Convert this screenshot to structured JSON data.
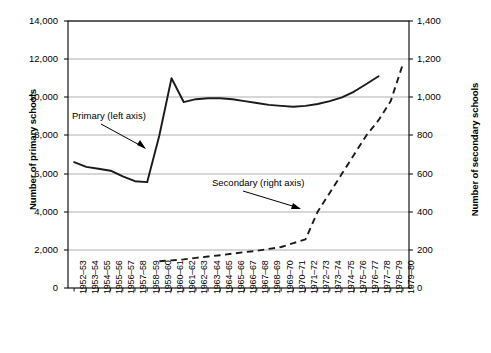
{
  "chart_data": {
    "type": "line",
    "title": "",
    "xlabel": "",
    "ylabel": "Number of primary schools",
    "y2label": "Number of secondary schools",
    "grid": true,
    "legend_position": "inline-annotations",
    "ylim": [
      0,
      14000
    ],
    "y2lim": [
      0,
      1400
    ],
    "yticks": [
      "0",
      "2,000",
      "4,000",
      "6,000",
      "8,000",
      "10,000",
      "12,000",
      "14,000"
    ],
    "ytick_values": [
      0,
      2000,
      4000,
      6000,
      8000,
      10000,
      12000,
      14000
    ],
    "y2ticks": [
      "0",
      "200",
      "400",
      "600",
      "800",
      "1,000",
      "1,200",
      "1,400"
    ],
    "y2tick_values": [
      0,
      200,
      400,
      600,
      800,
      1000,
      1200,
      1400
    ],
    "categories": [
      "1952–53",
      "1953–54",
      "1954–55",
      "1955–56",
      "1956–57",
      "1957–58",
      "1958–59",
      "1959–60",
      "1960–61",
      "1961–62",
      "1962–63",
      "1963–64",
      "1964–65",
      "1965–66",
      "1966–67",
      "1967–68",
      "1968–69",
      "1969–70",
      "1970–71",
      "1971–72",
      "1972–73",
      "1973–74",
      "1974–75",
      "1975–76",
      "1976–77",
      "1977–78",
      "1978–79",
      "1979–80"
    ],
    "series": [
      {
        "name": "Primary (left axis)",
        "axis": "left",
        "style": "solid",
        "values": [
          6600,
          6350,
          6250,
          6150,
          5850,
          5600,
          5550,
          8000,
          11000,
          9750,
          9900,
          9950,
          9950,
          9900,
          9800,
          9700,
          9600,
          9550,
          9500,
          9550,
          9650,
          9800,
          10000,
          10300,
          10700,
          11100,
          null,
          null
        ]
      },
      {
        "name": "Secondary (right axis)",
        "axis": "right",
        "style": "dashed",
        "values": [
          null,
          null,
          null,
          null,
          null,
          null,
          null,
          140,
          145,
          150,
          158,
          165,
          172,
          180,
          188,
          195,
          205,
          215,
          235,
          255,
          400,
          500,
          600,
          700,
          800,
          880,
          980,
          1175
        ]
      }
    ],
    "annotations": [
      {
        "text": "Primary (left axis)",
        "target_series": "Primary (left axis)"
      },
      {
        "text": "Secondary (right axis)",
        "target_series": "Secondary (right axis)"
      }
    ],
    "colors": {
      "primary_line": "#1a1a1a",
      "secondary_line": "#1a1a1a",
      "gridline": "#999999",
      "axis": "#000000",
      "background": "#ffffff"
    }
  }
}
